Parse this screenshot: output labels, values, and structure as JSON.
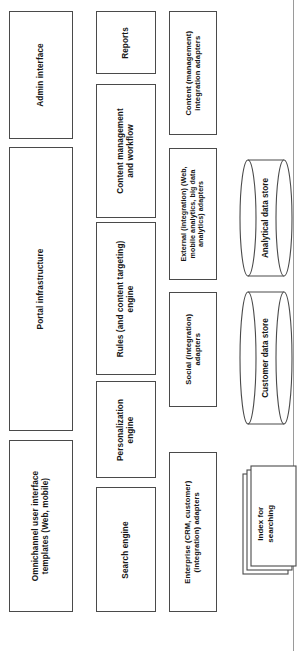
{
  "diagram": {
    "orientation": "rotated-90",
    "page_rule_color": "#9a9a9a",
    "node_border_color": "#4a4a4a",
    "node_fill_color": "#ffffff",
    "columns": [
      {
        "name": "presentation-column",
        "nodes": [
          {
            "id": "admin-interface",
            "label": "Admin interface",
            "shape": "rect"
          },
          {
            "id": "portal-infrastructure",
            "label": "Portal infrastructure",
            "shape": "rect"
          },
          {
            "id": "omnichannel-templates",
            "label": "Omnichannel user interface\ntemplates (Web, mobile)",
            "shape": "rect"
          }
        ]
      },
      {
        "name": "services-column",
        "nodes": [
          {
            "id": "reports",
            "label": "Reports",
            "shape": "rect"
          },
          {
            "id": "content-management-workflow",
            "label": "Content management\nand workflow",
            "shape": "rect"
          },
          {
            "id": "rules-engine",
            "label": "Rules (and content targeting)\nengine",
            "shape": "rect"
          },
          {
            "id": "personalization-engine",
            "label": "Personalization\nengine",
            "shape": "rect"
          },
          {
            "id": "search-engine",
            "label": "Search engine",
            "shape": "rect"
          }
        ]
      },
      {
        "name": "integration-column",
        "nodes": [
          {
            "id": "content-integration-adapters",
            "label": "Content (management)\nintegration adapters",
            "shape": "rect"
          },
          {
            "id": "external-integration-adapters",
            "label": "External (integration) (Web,\nmobile analytics, big data\nanalytics) adapters",
            "shape": "rect"
          },
          {
            "id": "social-integration-adapters",
            "label": "Social (integration)\nadapters",
            "shape": "rect"
          },
          {
            "id": "enterprise-integration-adapters",
            "label": "Enterprise (CRM, customer)\n(integration) adapters",
            "shape": "rect"
          }
        ]
      },
      {
        "name": "data-column",
        "nodes": [
          {
            "id": "analytical-data-store",
            "label": "Analytical data store",
            "shape": "cylinder"
          },
          {
            "id": "customer-data-store",
            "label": "Customer data store",
            "shape": "cylinder"
          },
          {
            "id": "index-for-searching",
            "label": "Index for\nsearching",
            "shape": "stacked-documents"
          }
        ]
      }
    ]
  }
}
